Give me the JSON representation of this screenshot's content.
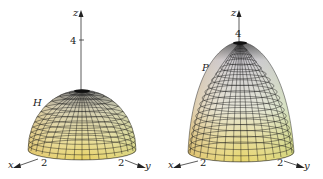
{
  "figures": [
    {
      "id": "hemisphere",
      "surface_label": "H",
      "axes": {
        "x": "x",
        "y": "y",
        "z": "z"
      },
      "ticks": {
        "z": "4",
        "x": "2",
        "y": "2"
      }
    },
    {
      "id": "paraboloid",
      "surface_label": "P",
      "axes": {
        "x": "x",
        "y": "y",
        "z": "z"
      },
      "ticks": {
        "z": "4",
        "x": "2",
        "y": "2"
      }
    }
  ],
  "colors": {
    "surface_top": "#9a9aa0",
    "surface_mid": "#e6e0c4",
    "surface_bottom": "#e8d870",
    "mesh": "#1a1a1a",
    "axis": "#333333"
  }
}
